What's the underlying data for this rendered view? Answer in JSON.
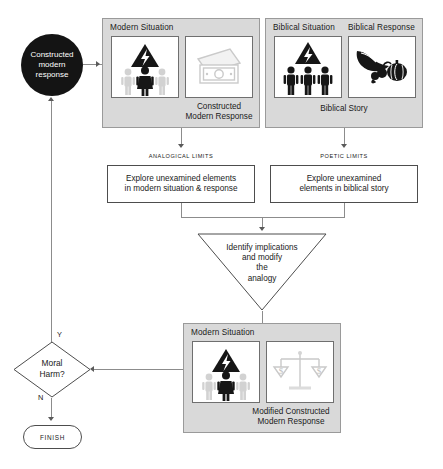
{
  "diagram": {
    "colors": {
      "panel_fill": "#d9d9d9",
      "panel_border": "#9a9a9a",
      "icon_box_fill": "#ffffff",
      "icon_box_border": "#6f6f6f",
      "line": "#8c8c8c",
      "node_fill": "#141414",
      "node_text": "#ffffff",
      "icon_dark": "#1a1a1a",
      "icon_light": "#cfcfcf"
    }
  },
  "start_node": {
    "label_line1": "Constructed",
    "label_line2": "modern",
    "label_line3": "response"
  },
  "modern_panel": {
    "title": "Modern Situation",
    "icon_situation": "hazard-people-icon",
    "icon_response": "banknotes-icon",
    "caption_line1": "Constructed",
    "caption_line2": "Modern Response"
  },
  "biblical_panel": {
    "title_situation": "Biblical Situation",
    "title_response": "Biblical Response",
    "icon_situation": "hazard-three-people-icon",
    "icon_response": "cornucopia-icon",
    "caption": "Biblical Story"
  },
  "limits": {
    "analogical": {
      "label": "ANALOGICAL LIMITS",
      "text_line1": "Explore unexamined elements",
      "text_line2": "in modern situation & response"
    },
    "poetic": {
      "label": "POETIC LIMITS",
      "text_line1": "Explore unexamined",
      "text_line2": "elements in biblical story"
    }
  },
  "triangle": {
    "line1": "Identify implications",
    "line2": "and modify",
    "line3": "the",
    "line4": "analogy"
  },
  "modified_panel": {
    "title": "Modern Situation",
    "icon_situation": "hazard-people-icon",
    "icon_response": "scales-dollar-icon",
    "caption_line1": "Modified Constructed",
    "caption_line2": "Modern Response"
  },
  "decision": {
    "line1": "Moral",
    "line2": "Harm?",
    "yes_label": "Y",
    "no_label": "N"
  },
  "finish": {
    "label": "FINISH"
  }
}
